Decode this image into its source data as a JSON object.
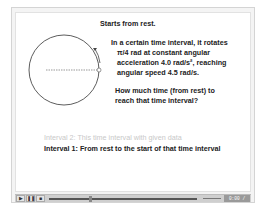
{
  "slide": {
    "title": "Starts from rest.",
    "problem_lines": [
      "In a certain time interval, it rotates",
      "π/4 rad at constant angular",
      "acceleration 4.0 rad/s², reaching",
      "angular speed 4.5 rad/s."
    ],
    "question_lines": [
      "How much time (from rest) to",
      "reach that time interval?"
    ],
    "interval2": "Interval 2: This time interval with given data",
    "interval1": "Interval 1: From rest to the start of that time interval"
  },
  "player": {
    "play_icon": "▶",
    "pause_icon": "❚❚",
    "stop_icon": "■",
    "time_display": "0:00 / 0:00",
    "progress_percent": 31
  }
}
